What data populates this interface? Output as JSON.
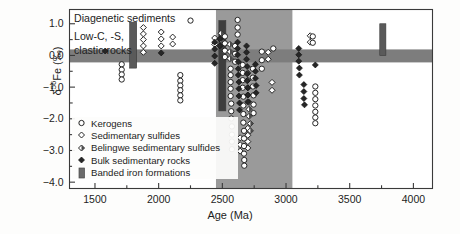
{
  "figure": {
    "background_color": "#fdfdfc",
    "frame_color": "#3a3a3a"
  },
  "annotations": {
    "top_label": "Diagenetic sediments",
    "left_label_line1": "Low-C, -S,",
    "left_label_line2": "clastic rocks"
  },
  "axes": {
    "x": {
      "title": "Age (Ma)",
      "ticklabels": [
        "1500",
        "2000",
        "2500",
        "3000",
        "3500",
        "4000"
      ],
      "tickvalues": [
        1500,
        2000,
        2500,
        3000,
        3500,
        4000
      ],
      "minor_step": 250,
      "range": [
        1300,
        4150
      ]
    },
    "y": {
      "title_html": "δ<sup>56</sup>Fe (‰)",
      "title_plain": "δ56Fe (‰)",
      "ticklabels": [
        "1.0",
        "0.0",
        "-1.0",
        "-2.0",
        "-3.0",
        "-4.0"
      ],
      "tickvalues": [
        1.0,
        0.0,
        -1.0,
        -2.0,
        -3.0,
        -4.0
      ],
      "minor_step": 0.5,
      "range": [
        -4.2,
        1.45
      ]
    }
  },
  "legend": {
    "items": [
      {
        "label": "Kerogens",
        "marker": "open-circle",
        "color": "#ffffff",
        "edge": "#1d1d1d"
      },
      {
        "label": "Sedimentary sulfides",
        "marker": "open-diamond",
        "color": "#ffffff",
        "edge": "#1d1d1d"
      },
      {
        "label": "Belingwe sedimentary sulfides",
        "marker": "half-filled-diamond",
        "color": "#8a8a8a",
        "edge": "#1d1d1d"
      },
      {
        "label": "Bulk sedimentary rocks",
        "marker": "filled-diamond",
        "color": "#2a2a2a",
        "edge": "#1d1d1d"
      },
      {
        "label": "Banded iron formations",
        "marker": "gray-bar",
        "color": "#6b6b6b",
        "edge": "#4a4a4a"
      }
    ]
  },
  "chart_data": {
    "type": "scatter",
    "title": "",
    "xlabel": "Age (Ma)",
    "ylabel": "δ56Fe (‰)",
    "xlim": [
      1300,
      4150
    ],
    "ylim": [
      -4.2,
      1.45
    ],
    "grid": false,
    "legend_position": "lower-left-inside",
    "shaded_regions": [
      {
        "name": "archean-neoarchean-band",
        "orientation": "vertical",
        "x_start": 2450,
        "x_end": 3050,
        "color": "#9a9a9a",
        "opacity": 1.0
      },
      {
        "name": "igneous-baseline-band",
        "orientation": "horizontal",
        "y_start": -0.22,
        "y_end": 0.19,
        "color": "#7d7d7d",
        "opacity": 1.0
      }
    ],
    "bif_bars": [
      {
        "name": "bif-1800",
        "x_center": 1800,
        "x_width": 55,
        "y_min": -0.4,
        "y_max": 1.05,
        "color": "#5a5a5a"
      },
      {
        "name": "bif-2500",
        "x_center": 2500,
        "x_width": 55,
        "y_min": -1.75,
        "y_max": 1.1,
        "color": "#3e3e3e"
      },
      {
        "name": "bif-3750",
        "x_center": 3760,
        "x_width": 48,
        "y_min": 0.0,
        "y_max": 1.0,
        "color": "#5a5a5a"
      }
    ],
    "series": [
      {
        "name": "Kerogens",
        "marker": "open-circle",
        "points": [
          [
            1710,
            -0.28
          ],
          [
            1710,
            -0.45
          ],
          [
            1710,
            -0.6
          ],
          [
            1710,
            -0.76
          ],
          [
            2170,
            -0.62
          ],
          [
            2170,
            -0.8
          ],
          [
            2170,
            -0.95
          ],
          [
            2170,
            -1.1
          ],
          [
            2170,
            -1.26
          ],
          [
            2170,
            -1.42
          ],
          [
            2250,
            1.1
          ],
          [
            2520,
            0.6
          ],
          [
            2520,
            0.38
          ],
          [
            2520,
            0.15
          ],
          [
            2520,
            -0.05
          ],
          [
            2620,
            1.12
          ],
          [
            2620,
            0.88
          ],
          [
            2620,
            0.66
          ],
          [
            2600,
            0.3
          ],
          [
            2600,
            0.05
          ],
          [
            2600,
            -0.2
          ],
          [
            2565,
            -0.42
          ],
          [
            2565,
            -0.62
          ],
          [
            2565,
            -0.84
          ],
          [
            2565,
            -1.05
          ],
          [
            2565,
            -1.28
          ],
          [
            2570,
            -1.52
          ],
          [
            2570,
            -1.76
          ],
          [
            2570,
            -1.99
          ],
          [
            2575,
            -2.24
          ],
          [
            2575,
            -2.5
          ],
          [
            2575,
            -2.72
          ],
          [
            2575,
            -2.96
          ],
          [
            2660,
            -0.3
          ],
          [
            2660,
            -0.55
          ],
          [
            2660,
            -0.78
          ],
          [
            2660,
            -1.02
          ],
          [
            2665,
            -1.3
          ],
          [
            2665,
            -1.58
          ],
          [
            2665,
            -1.85
          ],
          [
            2665,
            -2.12
          ],
          [
            2670,
            -2.38
          ],
          [
            2670,
            -2.62
          ],
          [
            2670,
            -2.86
          ],
          [
            2670,
            -3.1
          ],
          [
            2672,
            -3.3
          ],
          [
            2672,
            -3.48
          ],
          [
            2740,
            -0.42
          ],
          [
            2740,
            -0.7
          ],
          [
            2740,
            -0.98
          ],
          [
            2745,
            -1.26
          ],
          [
            2745,
            -1.55
          ],
          [
            2745,
            -1.82
          ],
          [
            2810,
            0.12
          ],
          [
            2810,
            -0.15
          ],
          [
            2810,
            -0.42
          ],
          [
            2900,
            0.22
          ],
          [
            3210,
            0.4
          ],
          [
            3210,
            0.6
          ],
          [
            3230,
            -0.98
          ],
          [
            3230,
            -1.18
          ],
          [
            3230,
            -1.38
          ],
          [
            3230,
            -1.58
          ],
          [
            3230,
            -1.78
          ],
          [
            3230,
            -1.96
          ],
          [
            3230,
            -2.14
          ]
        ]
      },
      {
        "name": "Sedimentary sulfides",
        "marker": "open-diamond",
        "points": [
          [
            1880,
            0.88
          ],
          [
            1880,
            0.68
          ],
          [
            1880,
            0.5
          ],
          [
            1880,
            0.3
          ],
          [
            1880,
            0.1
          ],
          [
            2020,
            0.74
          ],
          [
            2020,
            0.52
          ],
          [
            2020,
            0.3
          ],
          [
            2110,
            0.58
          ],
          [
            2110,
            0.36
          ],
          [
            2440,
            0.55
          ],
          [
            2440,
            0.35
          ],
          [
            2640,
            -2.6
          ],
          [
            2640,
            -2.82
          ],
          [
            2640,
            -3.02
          ],
          [
            2700,
            -2.3
          ],
          [
            2700,
            -2.52
          ],
          [
            2700,
            -2.72
          ],
          [
            2700,
            -2.92
          ],
          [
            2860,
            0.1
          ],
          [
            2860,
            -0.12
          ],
          [
            2890,
            -0.85
          ],
          [
            2890,
            -1.1
          ],
          [
            3190,
            0.62
          ],
          [
            3190,
            0.42
          ]
        ]
      },
      {
        "name": "Belingwe sedimentary sulfides",
        "marker": "half-filled-diamond",
        "points": [
          [
            2700,
            -0.55
          ],
          [
            2700,
            -0.78
          ],
          [
            2700,
            -1.02
          ],
          [
            2700,
            -1.25
          ],
          [
            2710,
            -1.48
          ],
          [
            2710,
            -1.7
          ],
          [
            2710,
            -1.92
          ],
          [
            2720,
            -2.15
          ],
          [
            2720,
            -2.38
          ],
          [
            2560,
            0.35
          ],
          [
            2560,
            0.12
          ],
          [
            2560,
            -0.1
          ],
          [
            2490,
            0.7
          ],
          [
            2490,
            0.48
          ]
        ]
      },
      {
        "name": "Bulk sedimentary rocks",
        "marker": "filled-diamond",
        "points": [
          [
            1580,
            0.14
          ],
          [
            2020,
            0.08
          ],
          [
            2440,
            0.42
          ],
          [
            2440,
            0.2
          ],
          [
            2440,
            -0.02
          ],
          [
            2440,
            -0.25
          ],
          [
            2480,
            0.52
          ],
          [
            2480,
            0.3
          ],
          [
            2620,
            0.42
          ],
          [
            2620,
            0.22
          ],
          [
            2620,
            0.02
          ],
          [
            2625,
            -0.2
          ],
          [
            2625,
            -0.42
          ],
          [
            2625,
            -0.62
          ],
          [
            2630,
            -0.84
          ],
          [
            2630,
            -1.05
          ],
          [
            2630,
            -1.28
          ],
          [
            2635,
            -1.5
          ],
          [
            2635,
            -1.72
          ],
          [
            2690,
            0.3
          ],
          [
            2690,
            0.1
          ],
          [
            2690,
            -0.12
          ],
          [
            2695,
            -0.35
          ],
          [
            2695,
            -0.58
          ],
          [
            2695,
            -0.8
          ],
          [
            2700,
            -1.02
          ],
          [
            2700,
            -1.25
          ],
          [
            2700,
            -1.46
          ],
          [
            2760,
            -0.28
          ],
          [
            2760,
            -0.5
          ],
          [
            2760,
            -0.72
          ],
          [
            2765,
            -0.95
          ],
          [
            2765,
            -1.18
          ],
          [
            3100,
            0.22
          ],
          [
            3100,
            0.02
          ],
          [
            3100,
            -0.18
          ],
          [
            3105,
            -0.4
          ],
          [
            3105,
            -0.62
          ],
          [
            3140,
            -0.92
          ],
          [
            3140,
            -1.14
          ],
          [
            3140,
            -1.36
          ],
          [
            3145,
            -1.56
          ],
          [
            3230,
            -0.3
          ]
        ]
      }
    ]
  }
}
